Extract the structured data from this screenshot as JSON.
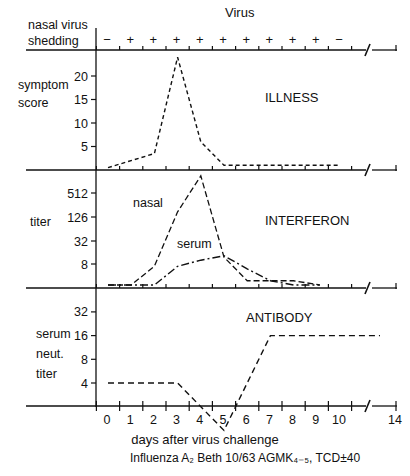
{
  "labels": {
    "virus_header": "Virus",
    "shedding_line1": "nasal virus",
    "shedding_line2": "shedding",
    "illness_ylabel_1": "symptom",
    "illness_ylabel_2": "score",
    "illness_title": "ILLNESS",
    "interferon_ylabel": "titer",
    "interferon_title": "INTERFERON",
    "nasal_label": "nasal",
    "serum_label": "serum",
    "antibody_ylabel_1": "serum",
    "antibody_ylabel_2": "neut.",
    "antibody_ylabel_3": "titer",
    "antibody_title": "ANTIBODY",
    "xlabel": "days after virus challenge",
    "caption": "Influenza A₂ Beth 10/63 AGMK₄₋₅, TCD±40"
  },
  "chart_data": [
    {
      "type": "table",
      "title": "nasal virus shedding",
      "x": [
        0,
        1,
        2,
        3,
        4,
        5,
        6,
        7,
        8,
        9,
        10
      ],
      "values": [
        "−",
        "+",
        "+",
        "+",
        "+",
        "+",
        "+",
        "+",
        "+",
        "+",
        "−"
      ]
    },
    {
      "type": "line",
      "title": "ILLNESS",
      "ylabel": "symptom score",
      "yticks": [
        5,
        10,
        15,
        20
      ],
      "x": [
        0,
        2,
        3,
        4,
        5,
        10
      ],
      "series": [
        {
          "name": "symptom score",
          "style": "dashed",
          "values": [
            0.5,
            3.5,
            24,
            6,
            1,
            1
          ]
        }
      ]
    },
    {
      "type": "line",
      "title": "INTERFERON",
      "ylabel": "titer",
      "yticks": [
        8,
        32,
        126,
        512
      ],
      "yscale": "log2",
      "series": [
        {
          "name": "nasal",
          "style": "dashed",
          "x": [
            0,
            1,
            2,
            3,
            4,
            5,
            6,
            7,
            8,
            9
          ],
          "values": [
            2,
            2,
            7,
            170,
            1400,
            12,
            3,
            3,
            3,
            1
          ]
        },
        {
          "name": "serum",
          "style": "dash-dot",
          "x": [
            0,
            1,
            2,
            3,
            4,
            5,
            6,
            7,
            8,
            9
          ],
          "values": [
            2,
            2,
            1.8,
            7,
            10,
            13,
            6,
            3,
            2,
            1.5
          ]
        }
      ]
    },
    {
      "type": "line",
      "title": "ANTIBODY",
      "ylabel": "serum neut. titer",
      "yticks": [
        4,
        8,
        16,
        32
      ],
      "yscale": "log2",
      "x": [
        0,
        3,
        5,
        7,
        14
      ],
      "series": [
        {
          "name": "serum neutralizing titer",
          "style": "dashed",
          "values": [
            4,
            4,
            1,
            16,
            16
          ]
        }
      ]
    }
  ],
  "xaxis": {
    "ticks": [
      "0",
      "1",
      "2",
      "3",
      "4",
      "5",
      "6",
      "7",
      "8",
      "9",
      "10",
      "14"
    ],
    "break_between": [
      "10",
      "14"
    ]
  }
}
